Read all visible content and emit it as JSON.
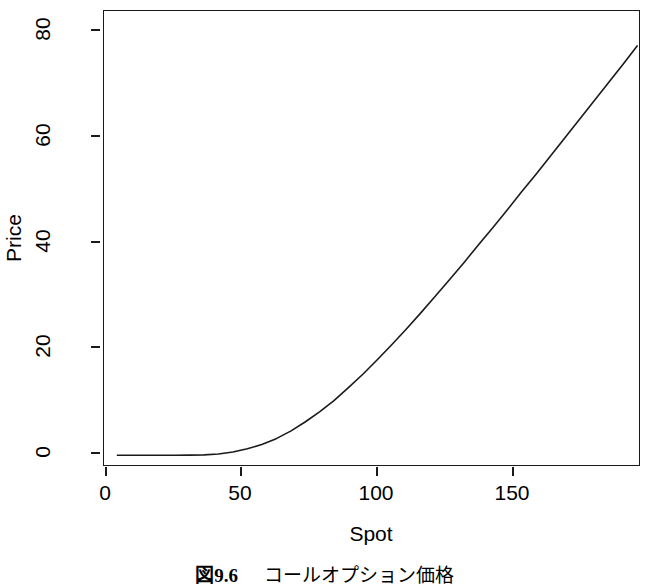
{
  "figure": {
    "caption_fig": "図",
    "caption_number": "9.6",
    "caption_text": "コールオプション価格"
  },
  "chart_data": {
    "type": "line",
    "title": "",
    "subtitle": "",
    "xlabel": "Spot",
    "ylabel": "Price",
    "xlim": [
      0,
      186
    ],
    "ylim": [
      -2,
      83
    ],
    "xticks": [
      0,
      50,
      100,
      150
    ],
    "xtick_labels": [
      "0",
      "50",
      "100",
      "150"
    ],
    "yticks": [
      0,
      20,
      40,
      60,
      80
    ],
    "ytick_labels": [
      "0",
      "20",
      "40",
      "60",
      "80"
    ],
    "grid": false,
    "legend": "none",
    "line_color": "#1a1a1a",
    "line_width": 1.6,
    "background": "#ffffff",
    "series": [
      {
        "name": "Call option price",
        "x": [
          5,
          10,
          15,
          20,
          25,
          30,
          35,
          40,
          45,
          50,
          55,
          60,
          65,
          70,
          75,
          80,
          85,
          90,
          95,
          100,
          105,
          110,
          115,
          120,
          125,
          130,
          135,
          140,
          145,
          150,
          155,
          160,
          165,
          170,
          175,
          180,
          185
        ],
        "y": [
          0.0,
          0.0,
          0.0,
          0.0,
          0.0,
          0.02,
          0.08,
          0.25,
          0.6,
          1.2,
          2.0,
          3.1,
          4.5,
          6.2,
          8.1,
          10.2,
          12.6,
          15.1,
          17.8,
          20.6,
          23.5,
          26.5,
          29.6,
          32.7,
          35.9,
          39.2,
          42.4,
          45.7,
          49.1,
          52.4,
          55.8,
          59.2,
          62.6,
          66.0,
          69.4,
          72.8,
          76.3
        ]
      }
    ]
  },
  "axes": {
    "x": {
      "ticks": [
        {
          "label": "0",
          "px": 105
        },
        {
          "label": "50",
          "px": 240
        },
        {
          "label": "100",
          "px": 376
        },
        {
          "label": "150",
          "px": 512
        }
      ]
    },
    "y": {
      "ticks": [
        {
          "label": "0",
          "px": 452
        },
        {
          "label": "20",
          "px": 346
        },
        {
          "label": "40",
          "px": 241
        },
        {
          "label": "60",
          "px": 135
        },
        {
          "label": "80",
          "px": 29
        }
      ]
    }
  }
}
